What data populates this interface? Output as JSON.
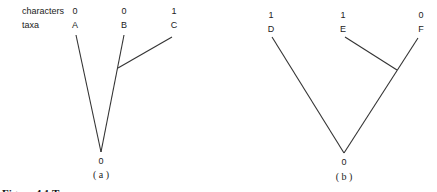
{
  "row_labels": {
    "characters": "characters",
    "taxa": "taxa"
  },
  "panels": [
    {
      "id": "a",
      "caption": "( a )",
      "root_state": "0",
      "taxa": [
        {
          "name": "A",
          "state": "0"
        },
        {
          "name": "B",
          "state": "0"
        },
        {
          "name": "C",
          "state": "1"
        }
      ],
      "topology": "(A,(B,C))"
    },
    {
      "id": "b",
      "caption": "( b )",
      "root_state": "0",
      "taxa": [
        {
          "name": "D",
          "state": "1"
        },
        {
          "name": "E",
          "state": "1"
        },
        {
          "name": "F",
          "state": "0"
        }
      ],
      "topology": "(D,(E,F))"
    }
  ],
  "figure_caption_partial": "Figure 4.1  Two ..."
}
